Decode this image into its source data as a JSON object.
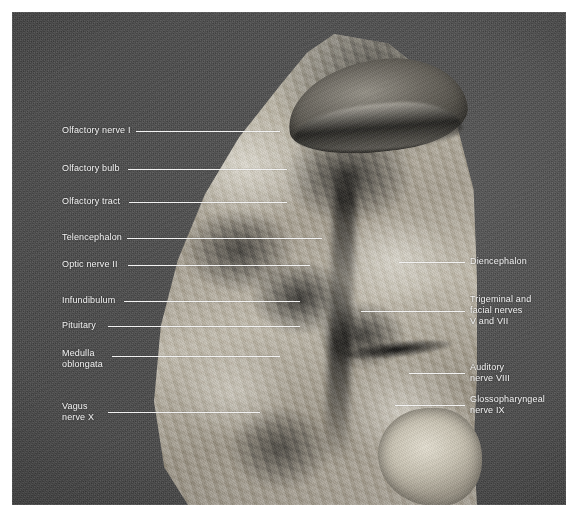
{
  "figure": {
    "kind": "anatomical-photograph",
    "caption_present": false,
    "background_color": "#4a4a4a",
    "label_color": "#f4f4f4",
    "leader_color": "#f2f2f2",
    "plate_border_color": "#ffffff"
  },
  "labels": {
    "left": [
      {
        "id": "olfactory-nerve-i",
        "text": "Olfactory nerve I"
      },
      {
        "id": "olfactory-bulb",
        "text": "Olfactory bulb"
      },
      {
        "id": "olfactory-tract",
        "text": "Olfactory tract"
      },
      {
        "id": "telencephalon",
        "text": "Telencephalon"
      },
      {
        "id": "optic-nerve-ii",
        "text": "Optic nerve II"
      },
      {
        "id": "infundibulum",
        "text": "Infundibulum"
      },
      {
        "id": "pituitary",
        "text": "Pituitary"
      },
      {
        "id": "medulla-oblongata",
        "text": "Medulla\noblongata"
      },
      {
        "id": "vagus-nerve-x",
        "text": "Vagus\nnerve X"
      }
    ],
    "right": [
      {
        "id": "diencephalon",
        "text": "Diencephalon"
      },
      {
        "id": "trigeminal-facial-nerves",
        "text": "Trigeminal and\nfacial nerves\nV and VII"
      },
      {
        "id": "auditory-nerve-viii",
        "text": "Auditory\nnerve VIII"
      },
      {
        "id": "glossopharyngeal-nerve-ix",
        "text": "Glossopharyngeal\nnerve IX"
      }
    ]
  }
}
